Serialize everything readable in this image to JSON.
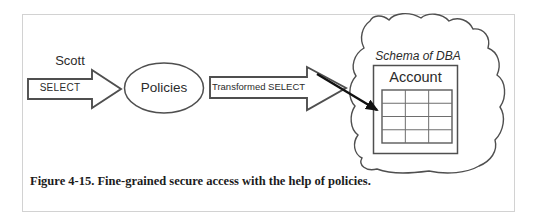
{
  "figure": {
    "caption": "Figure 4-15. Fine-grained secure access with the help of policies."
  },
  "diagram": {
    "user_label": "Scott",
    "select_arrow_label": "SELECT",
    "policies_label": "Policies",
    "transformed_arrow_label": "Transformed SELECT",
    "schema_label": "Schema of DBA",
    "table_title": "Account",
    "table_grid": {
      "rows": 4,
      "columns": 3
    },
    "colors": {
      "stroke": "#4f4f4f",
      "arrow": "#111111",
      "frame_border": "#d2d2d2",
      "background": "#ffffff",
      "text": "#2b2b2b"
    }
  }
}
